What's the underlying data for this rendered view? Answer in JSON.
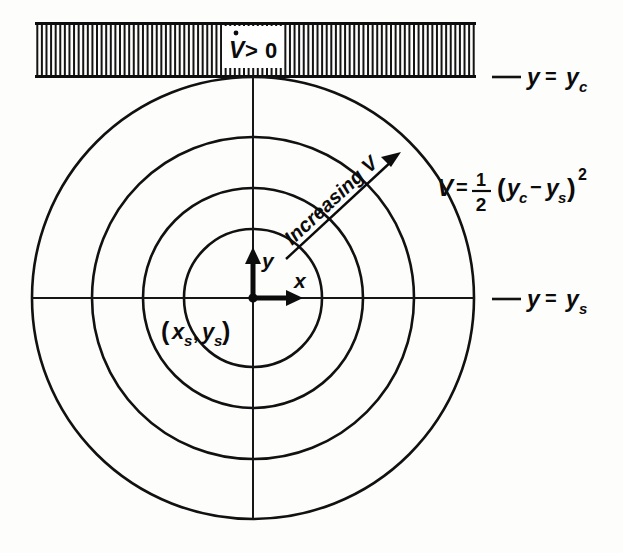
{
  "figure": {
    "background_color": "#fdfdfb",
    "ink_color": "#111111"
  },
  "band": {
    "name": "hatched-constraint-band",
    "x": 35,
    "y": 23,
    "width": 441,
    "height": 53,
    "hatch_count": 96,
    "label": {
      "text": "V > 0",
      "symbol_base": "V",
      "dot_accent": true,
      "relation": ">",
      "value": "0",
      "patch_x": 222,
      "patch_y": 26,
      "patch_width": 62,
      "patch_height": 42
    }
  },
  "boundary_labels": [
    {
      "id": "y-equals-yc",
      "lhs": "y",
      "equals": "=",
      "rhs_base": "y",
      "rhs_sub": "c",
      "dash_x1": 492,
      "dash_x2": 521,
      "text_x": 527,
      "text_y": 83
    },
    {
      "id": "y-equals-ys",
      "lhs": "y",
      "equals": "=",
      "rhs_base": "y",
      "rhs_sub": "s",
      "dash_x1": 492,
      "dash_x2": 521,
      "text_x": 527,
      "text_y": 305
    }
  ],
  "equation": {
    "id": "lyapunov-function",
    "lhs": "V",
    "equals": "=",
    "numerator": "1",
    "denominator": "2",
    "open_paren": "(",
    "term1_base": "y",
    "term1_sub": "c",
    "minus": "−",
    "term2_base": "y",
    "term2_sub": "s",
    "close_paren": ")",
    "exponent": "2",
    "x": 437,
    "y": 188
  },
  "level_sets": {
    "name": "concentric-level-curves",
    "center_x": 253,
    "center_y": 298,
    "radii": [
      69,
      110,
      161,
      221
    ],
    "count": 4
  },
  "axes": {
    "center_label": {
      "open": "(",
      "x_base": "x",
      "x_sub": "s",
      "comma": ",",
      "y_base": "y",
      "y_sub": "s",
      "close": ")",
      "x": 163,
      "y": 334
    },
    "x_axis": {
      "label": "x",
      "label_x": 300,
      "label_y": 286,
      "arrow_from_x": 253,
      "arrow_to_x": 297,
      "y": 298,
      "line_x1": 32,
      "line_x2": 475
    },
    "y_axis": {
      "label": "y",
      "label_x": 268,
      "label_y": 262,
      "arrow_from_y": 298,
      "arrow_to_y": 249,
      "x": 253,
      "line_y1": 77,
      "line_y2": 519
    },
    "origin_dot_r": 4.5
  },
  "increasing_arrow": {
    "name": "increasing-v-arrow",
    "label": "Increasing V",
    "from_x": 286,
    "from_y": 259,
    "to_x": 401,
    "to_y": 152,
    "rotation_deg": -43,
    "text_x": 296,
    "text_y": 243
  }
}
